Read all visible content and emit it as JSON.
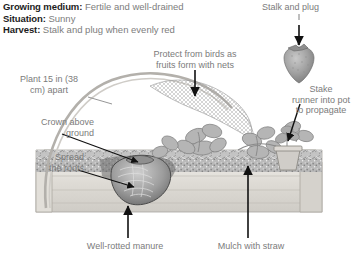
{
  "page": {
    "background_color": "#ffffff",
    "text_color": "#7b7b7b",
    "heading_color": "#1c1c1c"
  },
  "header": {
    "rows": [
      {
        "key": "Growing medium:",
        "value": "Fertile and well-drained"
      },
      {
        "key": "Situation:",
        "value": "Sunny"
      },
      {
        "key": "Harvest:",
        "value": "Stalk and plug when evenly red"
      }
    ],
    "growing_medium_key": "Growing medium:",
    "growing_medium_value": "Fertile and well-drained",
    "situation_key": "Situation:",
    "situation_value": "Sunny",
    "harvest_key": "Harvest:",
    "harvest_value": "Stalk and plug when evenly red"
  },
  "callouts": {
    "stalk_and_plug": "Stalk and plug",
    "protect_from_birds": "Protect from birds as\nfruits form with nets",
    "plant_spacing": "Plant 15 in (38\ncm) apart",
    "stake_runner": "Stake\nrunner into pot\nto propagate",
    "crown_above_ground": "Crown above\nground",
    "spread_the_roots": "Spread\nthe roots",
    "well_rotted_manure": "Well-rotted manure",
    "mulch_with_straw": "Mulch with straw"
  },
  "illustration": {
    "description": "Cross-section of a raised wooden strawberry bed with netting hoop, strawberry plants, runner staked into a pot, root crown detail and mulch layer",
    "parts": [
      "strawberry-fruit",
      "netting-hoop",
      "netting-mesh",
      "strawberry-plants",
      "runner-pot",
      "root-crown",
      "soil-layer",
      "mulch-straw",
      "manure-layer",
      "wooden-bed"
    ],
    "colors": {
      "line": "#8d8d8d",
      "dark_line": "#3a3a3a",
      "soil": "#9a9a9a",
      "wood": "#d8d6d2",
      "fruit": "#a0a0a0"
    }
  }
}
